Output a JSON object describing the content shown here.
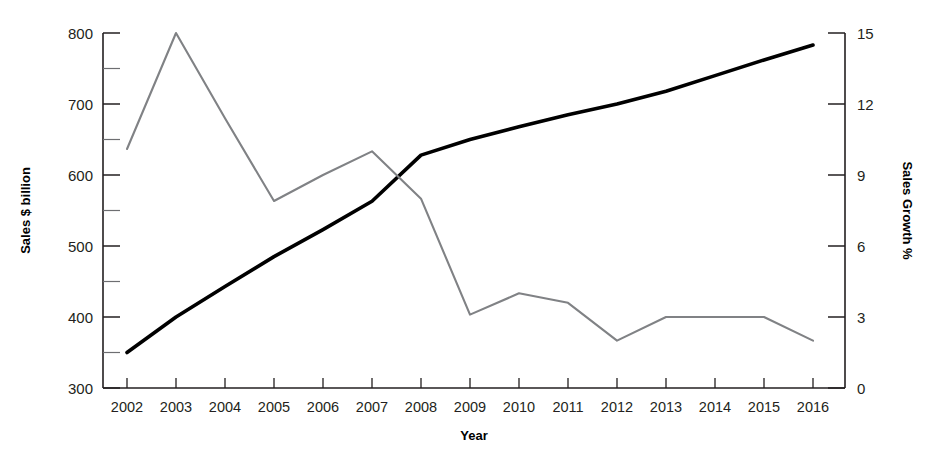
{
  "chart_data": {
    "type": "line",
    "title": "",
    "xlabel": "Year",
    "ylabel": "Sales $ billion",
    "y2label": "Sales Growth %",
    "grid": false,
    "legend": "none",
    "categories": [
      "2002",
      "2003",
      "2004",
      "2005",
      "2006",
      "2007",
      "2008",
      "2009",
      "2010",
      "2011",
      "2012",
      "2013",
      "2014",
      "2015",
      "2016"
    ],
    "x": [
      2002,
      2003,
      2004,
      2005,
      2006,
      2007,
      2008,
      2009,
      2010,
      2011,
      2012,
      2013,
      2014,
      2015,
      2016
    ],
    "ylim": [
      300,
      800
    ],
    "y2lim": [
      0,
      15
    ],
    "yticks": [
      300,
      400,
      500,
      600,
      700,
      800
    ],
    "yticks_minor": [
      350,
      450,
      550,
      650,
      750
    ],
    "y2ticks": [
      0,
      3,
      6,
      9,
      12,
      15
    ],
    "series": [
      {
        "name": "Sales $ billion",
        "axis": "left",
        "color": "#000000",
        "values": [
          350,
          400,
          443,
          485,
          523,
          563,
          628,
          650,
          668,
          685,
          700,
          718,
          740,
          762,
          783
        ]
      },
      {
        "name": "Sales Growth %",
        "axis": "right",
        "color": "#808285",
        "values": [
          10.1,
          15.0,
          11.4,
          7.9,
          9.0,
          10.0,
          8.0,
          3.1,
          4.0,
          3.6,
          2.0,
          3.0,
          3.0,
          3.0,
          2.0
        ]
      }
    ]
  },
  "axes": {
    "left": {
      "title": "Sales $ billion",
      "tick_labels": [
        "800",
        "700",
        "600",
        "500",
        "400",
        "300"
      ]
    },
    "right": {
      "title": "Sales Growth %",
      "tick_labels": [
        "15",
        "12",
        "9",
        "6",
        "3",
        "0"
      ]
    },
    "bottom": {
      "title": "Year",
      "tick_labels": [
        "2002",
        "2003",
        "2004",
        "2005",
        "2006",
        "2007",
        "2008",
        "2009",
        "2010",
        "2011",
        "2012",
        "2013",
        "2014",
        "2015",
        "2016"
      ]
    }
  }
}
